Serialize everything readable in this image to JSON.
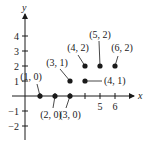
{
  "chart_data": {
    "type": "scatter",
    "title": "",
    "xlabel": "x",
    "ylabel": "y",
    "xlim": [
      -1,
      7
    ],
    "ylim": [
      -2.5,
      5
    ],
    "grid": false,
    "x_ticks": [
      1,
      2,
      3,
      4,
      5,
      6
    ],
    "x_tick_labels": [
      "5",
      "6"
    ],
    "x_tick_label_values": [
      5,
      6
    ],
    "y_ticks": [
      -2,
      -1,
      1,
      2,
      3,
      4
    ],
    "y_tick_labels": [
      "-2",
      "-1",
      "1",
      "2",
      "3",
      "4"
    ],
    "points": [
      {
        "x": 1,
        "y": 0,
        "label": "(1, 0)"
      },
      {
        "x": 2,
        "y": 0,
        "label": "(2, 0)"
      },
      {
        "x": 3,
        "y": 0,
        "label": "(3, 0)"
      },
      {
        "x": 3,
        "y": 1,
        "label": "(3, 1)"
      },
      {
        "x": 4,
        "y": 1,
        "label": "(4, 1)"
      },
      {
        "x": 4,
        "y": 2,
        "label": "(4, 2)"
      },
      {
        "x": 5,
        "y": 2,
        "label": "(5, 2)"
      },
      {
        "x": 6,
        "y": 2,
        "label": "(6, 2)"
      }
    ]
  }
}
